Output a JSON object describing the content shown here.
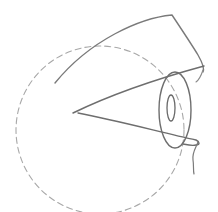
{
  "image": {
    "subject": "pencil sketch of an eye in profile inside a dashed circle",
    "colors": {
      "background": "#ffffff",
      "stroke_dark": "#6e6e6e",
      "stroke_light": "#a8a8a8"
    },
    "elements": [
      "eyeball-guide-circle",
      "upper-eyelid",
      "upper-lid-lower-edge",
      "lower-eyelid",
      "iris",
      "pupil",
      "cheek-line"
    ]
  }
}
